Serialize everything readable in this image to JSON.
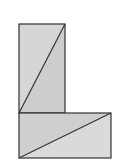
{
  "diagram": {
    "colors": {
      "background": "#ffffff",
      "fill": "#d2d2d2",
      "fill_light": "#dadada",
      "stroke": "#333333"
    },
    "shapes": [
      {
        "name": "vertical-rectangle",
        "x": 19,
        "y": 24,
        "width": 46,
        "height": 89,
        "diagonal": "bottom-left to top-right"
      },
      {
        "name": "horizontal-rectangle",
        "x": 19,
        "y": 113,
        "width": 92,
        "height": 45,
        "diagonal": "bottom-left to top-right"
      }
    ]
  }
}
